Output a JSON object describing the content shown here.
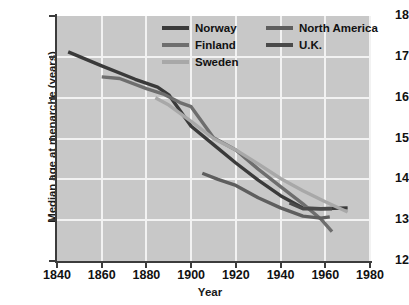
{
  "chart_data": {
    "type": "line",
    "title": "",
    "xlabel": "Year",
    "ylabel": "Median age at menarche (years)",
    "xlim": [
      1840,
      1980
    ],
    "ylim": [
      12,
      18
    ],
    "xticks": [
      1840,
      1860,
      1880,
      1900,
      1920,
      1940,
      1960,
      1980
    ],
    "yticks": [
      12,
      13,
      14,
      15,
      16,
      17,
      18
    ],
    "grid": true,
    "legend_position": "top-right",
    "plot_background": "#c8c8c8",
    "grid_color": "#f2f2f2",
    "series": [
      {
        "name": "Norway",
        "color": "#3a3a3a",
        "x": [
          1845,
          1860,
          1875,
          1885,
          1890,
          1900,
          1910,
          1920,
          1930,
          1940,
          1950,
          1958,
          1970
        ],
        "values": [
          17.12,
          16.78,
          16.45,
          16.26,
          16.07,
          15.3,
          14.85,
          14.4,
          13.98,
          13.6,
          13.3,
          13.28,
          13.3
        ]
      },
      {
        "name": "Finland",
        "color": "#6e6e6e",
        "x": [
          1860,
          1868,
          1880,
          1888,
          1895,
          1900,
          1910,
          1920,
          1930,
          1940,
          1950,
          1958,
          1963
        ],
        "values": [
          16.51,
          16.47,
          16.22,
          16.08,
          15.88,
          15.78,
          15.02,
          14.72,
          14.25,
          13.82,
          13.4,
          13.03,
          12.72
        ]
      },
      {
        "name": "Sweden",
        "color": "#a8a8a8",
        "x": [
          1884,
          1890,
          1900,
          1910,
          1920,
          1930,
          1940,
          1950,
          1960,
          1970
        ],
        "values": [
          16.0,
          15.82,
          15.42,
          15.0,
          14.72,
          14.38,
          14.02,
          13.72,
          13.45,
          13.2
        ]
      },
      {
        "name": "North America",
        "color": "#5e5e5e",
        "x": [
          1905,
          1912,
          1920,
          1930,
          1940,
          1950,
          1958,
          1962
        ],
        "values": [
          14.15,
          14.0,
          13.85,
          13.55,
          13.3,
          13.1,
          13.05,
          13.08
        ]
      },
      {
        "name": "U.K.",
        "color": "#4a4a4a",
        "x": [
          1944,
          1950,
          1958,
          1963
        ],
        "values": [
          13.42,
          13.28,
          13.28,
          13.28
        ]
      }
    ],
    "legend": [
      {
        "label": "Norway",
        "color": "#3a3a3a"
      },
      {
        "label": "Finland",
        "color": "#6e6e6e"
      },
      {
        "label": "Sweden",
        "color": "#a8a8a8"
      },
      {
        "label": "North America",
        "color": "#5e5e5e"
      },
      {
        "label": "U.K.",
        "color": "#4a4a4a"
      }
    ],
    "xtick_labels": [
      "1840",
      "1860",
      "1880",
      "1900",
      "1920",
      "1940",
      "1960",
      "1980"
    ],
    "ytick_labels": [
      "12",
      "13",
      "14",
      "15",
      "16",
      "17",
      "18"
    ]
  }
}
